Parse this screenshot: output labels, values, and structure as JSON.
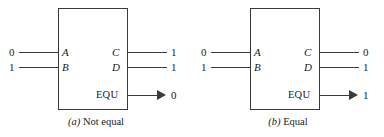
{
  "figure": {
    "type": "logic-block-diagram",
    "panels": [
      {
        "id": "a",
        "caption_label": "(a)",
        "caption_title": "Not equal",
        "inputs": [
          {
            "port": "A",
            "value": "0"
          },
          {
            "port": "B",
            "value": "1"
          }
        ],
        "outputs": [
          {
            "port": "C",
            "value": "1"
          },
          {
            "port": "D",
            "value": "1"
          },
          {
            "port": "EQU",
            "value": "0"
          }
        ]
      },
      {
        "id": "b",
        "caption_label": "(b)",
        "caption_title": "Equal",
        "inputs": [
          {
            "port": "A",
            "value": "0"
          },
          {
            "port": "B",
            "value": "1"
          }
        ],
        "outputs": [
          {
            "port": "C",
            "value": "0"
          },
          {
            "port": "D",
            "value": "1"
          },
          {
            "port": "EQU",
            "value": "1"
          }
        ]
      }
    ]
  },
  "colors": {
    "background": "#ffffff",
    "stroke": "#3a3a3a",
    "text": "#1a1a1a"
  }
}
